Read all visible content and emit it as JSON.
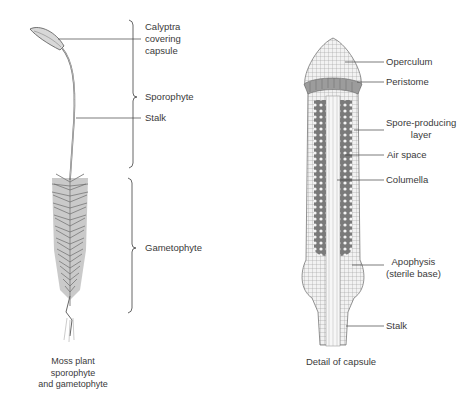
{
  "left_figure": {
    "caption_lines": [
      "Moss plant",
      "sporophyte",
      "and gametophyte"
    ],
    "labels": {
      "calyptra": [
        "Calyptra",
        "covering",
        "capsule"
      ],
      "sporophyte": "Sporophyte",
      "stalk": "Stalk",
      "gametophyte": "Gametophyte"
    }
  },
  "right_figure": {
    "caption": "Detail of capsule",
    "labels": {
      "operculum": "Operculum",
      "peristome": "Peristome",
      "spore_layer": [
        "Spore-producing",
        "layer"
      ],
      "air_space": "Air space",
      "columella": "Columella",
      "apophysis": [
        "Apophysis",
        "(sterile base)"
      ],
      "stalk": "Stalk"
    }
  },
  "colors": {
    "ink": "#555555",
    "fill": "#a8a8a8",
    "dark": "#6a6a6a",
    "background": "#ffffff"
  }
}
